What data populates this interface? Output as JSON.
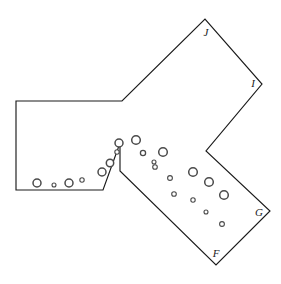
{
  "figure": {
    "background_color": "#ffffff",
    "outline_color": "#1a1a1a",
    "marker_stroke_color": "#4a4a4a",
    "marker_fill_color": "#ffffff",
    "label_color": "#222222",
    "canvas": {
      "width": 281,
      "height": 284
    }
  },
  "polygon": {
    "name": "region-boundary",
    "closed": true,
    "points": [
      [
        16,
        101
      ],
      [
        122,
        101
      ],
      [
        205,
        19
      ],
      [
        262,
        84
      ],
      [
        206,
        151
      ],
      [
        270,
        211
      ],
      [
        216,
        265
      ],
      [
        120,
        171
      ],
      [
        120,
        143
      ],
      [
        103,
        190
      ],
      [
        16,
        190
      ]
    ],
    "points_string": "16,101 122,101 205,19 262,84 206,151 270,211 216,265 120,171 120,143 103,190 16,190"
  },
  "vertex_labels": [
    {
      "text": "J",
      "x": 206,
      "y": 33
    },
    {
      "text": "I",
      "x": 253,
      "y": 84
    },
    {
      "text": "G",
      "x": 259,
      "y": 213
    },
    {
      "text": "F",
      "x": 216,
      "y": 254
    }
  ],
  "markers": [
    {
      "cx": 37,
      "cy": 183,
      "r": 4.0
    },
    {
      "cx": 54,
      "cy": 185,
      "r": 2.0
    },
    {
      "cx": 69,
      "cy": 183,
      "r": 4.0
    },
    {
      "cx": 82,
      "cy": 180,
      "r": 2.2
    },
    {
      "cx": 102,
      "cy": 172,
      "r": 4.0
    },
    {
      "cx": 110,
      "cy": 163,
      "r": 3.7
    },
    {
      "cx": 117,
      "cy": 152,
      "r": 2.2
    },
    {
      "cx": 119,
      "cy": 143,
      "r": 4.0
    },
    {
      "cx": 136,
      "cy": 140,
      "r": 4.3
    },
    {
      "cx": 143,
      "cy": 153,
      "r": 2.6
    },
    {
      "cx": 154,
      "cy": 162,
      "r": 2.0
    },
    {
      "cx": 163,
      "cy": 152,
      "r": 4.3
    },
    {
      "cx": 155,
      "cy": 167,
      "r": 2.3
    },
    {
      "cx": 170,
      "cy": 178,
      "r": 2.4
    },
    {
      "cx": 193,
      "cy": 172,
      "r": 4.3
    },
    {
      "cx": 174,
      "cy": 194,
      "r": 2.3
    },
    {
      "cx": 209,
      "cy": 182,
      "r": 4.3
    },
    {
      "cx": 224,
      "cy": 195,
      "r": 4.3
    },
    {
      "cx": 193,
      "cy": 200,
      "r": 2.2
    },
    {
      "cx": 206,
      "cy": 212,
      "r": 2.0
    },
    {
      "cx": 222,
      "cy": 224,
      "r": 2.4
    }
  ]
}
